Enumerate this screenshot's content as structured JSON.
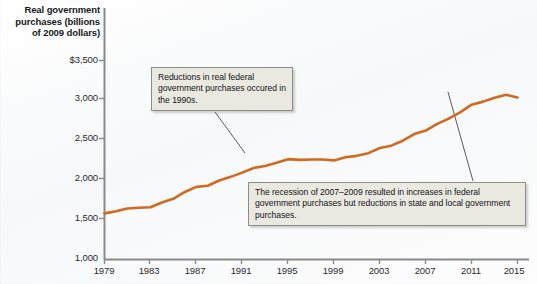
{
  "axis_title": {
    "line1": "Real government",
    "line2": "purchases (billions",
    "line3": "of 2009 dollars)"
  },
  "annotations": {
    "callout_1": "Reductions in real federal government purchases occured in the 1990s.",
    "callout_2": "The recession of 2007–2009 resulted in increases in federal government purchases but reductions in state and local government purchases."
  },
  "colors": {
    "line": "#D2691E",
    "line_light": "#E0803C",
    "axis": "#8a8a8e",
    "callout_fill": "#E9E9E1",
    "callout_border": "#8D8D85",
    "leader_line": "#5a5a62",
    "text": "#18181A"
  },
  "chart_data": {
    "type": "line",
    "title": "Real government purchases (billions of 2009 dollars)",
    "xlabel": "",
    "ylabel": "Real government purchases (billions of 2009 dollars)",
    "xlim": [
      1979,
      2015
    ],
    "ylim": [
      1000,
      3500
    ],
    "ytick_labels": [
      "$3,500",
      "3,000",
      "2,500",
      "2,000",
      "1,500",
      "1,000"
    ],
    "ytick_values": [
      3500,
      3000,
      2500,
      2000,
      1500,
      1000
    ],
    "xtick_labels": [
      "1979",
      "1983",
      "1987",
      "1991",
      "1995",
      "1999",
      "2003",
      "2007",
      "2011",
      "2015"
    ],
    "xtick_values": [
      1979,
      1983,
      1987,
      1991,
      1995,
      1999,
      2003,
      2007,
      2011,
      2015
    ],
    "grid": false,
    "legend": "none",
    "series": [
      {
        "name": "Real government purchases",
        "x": [
          1979,
          1980,
          1981,
          1982,
          1983,
          1984,
          1985,
          1986,
          1987,
          1988,
          1989,
          1990,
          1991,
          1992,
          1993,
          1994,
          1995,
          1996,
          1997,
          1998,
          1999,
          2000,
          2001,
          2002,
          2003,
          2004,
          2005,
          2006,
          2007,
          2008,
          2009,
          2010,
          2011,
          2012,
          2013,
          2014,
          2015
        ],
        "values": [
          1570,
          1600,
          1615,
          1650,
          1655,
          1700,
          1760,
          1830,
          1900,
          1935,
          1980,
          2030,
          2085,
          2130,
          2180,
          2215,
          2245,
          2250,
          2240,
          2250,
          2255,
          2270,
          2295,
          2330,
          2385,
          2440,
          2490,
          2560,
          2620,
          2690,
          2770,
          2860,
          2930,
          2980,
          3030,
          3060,
          3050
        ]
      }
    ],
    "annotations": [
      {
        "text": "Reductions in real federal government purchases occured in the 1990s.",
        "points_to_year": 1994
      },
      {
        "text": "The recession of 2007–2009 resulted in increases in federal government purchases but reductions in state and local government purchases.",
        "points_to_year": 2010
      }
    ]
  }
}
